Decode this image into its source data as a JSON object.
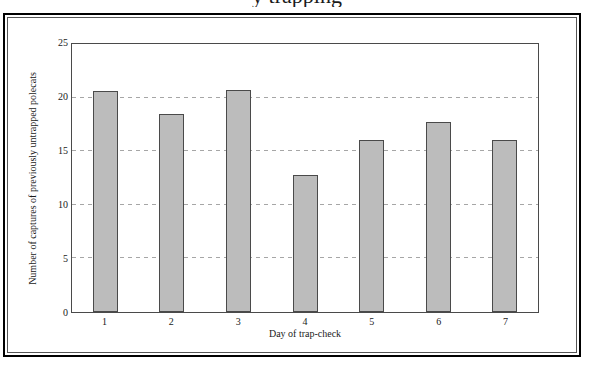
{
  "figure": {
    "title_fragment": "y trapping",
    "background": "#ffffff",
    "outer_border_color": "#000000",
    "inner_border_color": "#555555"
  },
  "chart_data": {
    "type": "bar",
    "title_visible_fragment": "y trapping",
    "categories": [
      "1",
      "2",
      "3",
      "4",
      "5",
      "6",
      "7"
    ],
    "values": [
      20.6,
      18.5,
      20.7,
      12.8,
      16.0,
      17.7,
      16.0
    ],
    "xlabel": "Day of trap-check",
    "ylabel": "Number of captures of previously untrapped polecats",
    "ylim": [
      0,
      25
    ],
    "yticks": [
      0,
      5,
      10,
      15,
      20,
      25
    ],
    "gridlines": [
      5,
      10,
      15,
      20
    ],
    "grid": "horizontal-dashed",
    "legend": "none",
    "bar_fill": "#bcbcbc",
    "bar_border": "#4a4a4a",
    "gridline_color": "#a6a6a6",
    "axis_color": "#4a4a4a",
    "text_color": "#1a1a1a"
  }
}
